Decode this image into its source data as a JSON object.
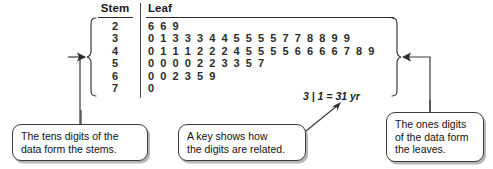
{
  "plot": {
    "headers": {
      "stem": "Stem",
      "leaf": "Leaf"
    },
    "rows": [
      {
        "stem": "2",
        "leaf": "6  6  9"
      },
      {
        "stem": "3",
        "leaf": "0  1  3  3  3  4  4  5  5  5  5  7  7  8  8  9  9"
      },
      {
        "stem": "4",
        "leaf": "0  1  1  1  2  2  2  4  5  5  5  5  6  6  6  6  7  8  9"
      },
      {
        "stem": "5",
        "leaf": "0  0  0  0  2  2  3  3  5  7"
      },
      {
        "stem": "6",
        "leaf": "0  0  2  3  5  9"
      },
      {
        "stem": "7",
        "leaf": "0"
      }
    ],
    "key": "3 | 1 = 31 yr"
  },
  "callouts": {
    "stems": {
      "line1": "The tens digits of the",
      "line2": "data form the stems."
    },
    "key": {
      "line1": "A key shows how",
      "line2": "the digits are related."
    },
    "leaves": {
      "line1": "The ones digits",
      "line2": "of the data form",
      "line3": "the leaves."
    }
  },
  "colors": {
    "ink": "#2b2b2b",
    "rule": "#3c3c3c",
    "background": "#ffffff"
  }
}
